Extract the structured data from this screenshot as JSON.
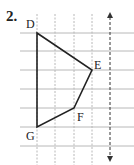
{
  "problem": {
    "number": "2."
  },
  "grid": {
    "vertical_x": [
      37,
      55,
      74,
      92
    ],
    "horizontal_y": [
      33,
      51,
      70,
      89,
      108,
      127,
      146
    ],
    "x_start": 20,
    "x_end": 134,
    "y_start": 14,
    "y_end": 165,
    "line_color": "#b8b8b8"
  },
  "mirror_line": {
    "x": 110,
    "y_top": 12,
    "y_bottom": 162,
    "color": "#333333"
  },
  "polygon": {
    "vertices": [
      {
        "label": "D",
        "x": 37,
        "y": 33,
        "label_x": 26,
        "label_y": 17
      },
      {
        "label": "E",
        "x": 92,
        "y": 70,
        "label_x": 94,
        "label_y": 58
      },
      {
        "label": "F",
        "x": 74,
        "y": 108,
        "label_x": 77,
        "label_y": 110
      },
      {
        "label": "G",
        "x": 37,
        "y": 127,
        "label_x": 26,
        "label_y": 129
      }
    ],
    "stroke": "#222222"
  }
}
